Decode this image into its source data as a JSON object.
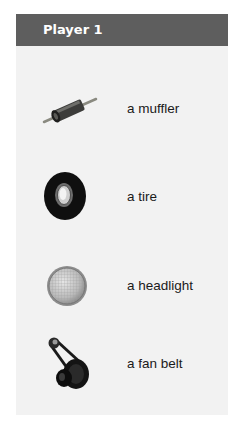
{
  "header": {
    "title": "Player 1"
  },
  "items": [
    {
      "icon": "muffler-icon",
      "label": "a muffler"
    },
    {
      "icon": "tire-icon",
      "label": "a tire"
    },
    {
      "icon": "headlight-icon",
      "label": "a headlight"
    },
    {
      "icon": "fan-belt-icon",
      "label": "a fan belt"
    }
  ],
  "colors": {
    "header_bg": "#5e5e5e",
    "header_text": "#ffffff",
    "panel_bg": "#f2f2f2",
    "label_text": "#1a1a1a"
  }
}
